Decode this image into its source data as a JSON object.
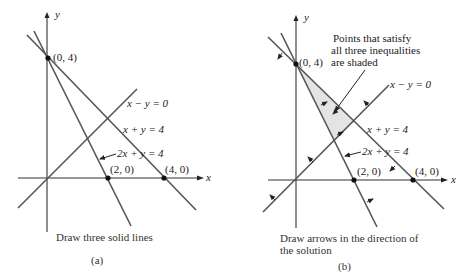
{
  "figure": {
    "panels": [
      {
        "id": "a",
        "caption": "Draw three solid lines",
        "sublabel": "(a)",
        "axes": {
          "x_label": "x",
          "y_label": "y"
        },
        "points": [
          {
            "label": "(0, 4)",
            "x": 0,
            "y": 4
          },
          {
            "label": "(2, 0)",
            "x": 2,
            "y": 0
          },
          {
            "label": "(4, 0)",
            "x": 4,
            "y": 0
          }
        ],
        "lines": [
          {
            "label": "x − y = 0"
          },
          {
            "label": "x + y = 4"
          },
          {
            "label": "2x + y = 4"
          }
        ]
      },
      {
        "id": "b",
        "caption_line1": "Draw arrows in the direction of",
        "caption_line2": "the solution",
        "sublabel": "(b)",
        "annotation_line1": "Points that satisfy",
        "annotation_line2": "all three inequalities",
        "annotation_line3": "are shaded",
        "axes": {
          "x_label": "x",
          "y_label": "y"
        },
        "points": [
          {
            "label": "(0, 4)",
            "x": 0,
            "y": 4
          },
          {
            "label": "(2, 0)",
            "x": 2,
            "y": 0
          },
          {
            "label": "(4, 0)",
            "x": 4,
            "y": 0
          }
        ],
        "lines": [
          {
            "label": "x − y = 0"
          },
          {
            "label": "x + y = 4"
          },
          {
            "label": "2x + y = 4"
          }
        ]
      }
    ],
    "colors": {
      "line": "#555555",
      "shade": "#e4e4e4",
      "text": "#222222"
    }
  }
}
